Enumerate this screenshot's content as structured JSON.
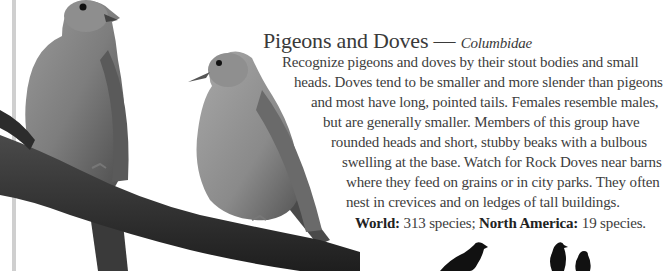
{
  "header": {
    "title": "Pigeons and Doves",
    "dash": " — ",
    "family": "Columbidae"
  },
  "body": {
    "lines": [
      "Recognize pigeons and doves by their stout bodies and small",
      "heads. Doves tend to be smaller and more slender than pigeons",
      "and most have long, pointed tails. Females resemble males,",
      "but are generally smaller. Members of this group have",
      "rounded heads and short, stubby beaks with a bulbous",
      "swelling at the base. Watch for Rock Doves near barns",
      "where they feed on grains or in city parks. They often",
      "nest in crevices and on ledges of tall buildings."
    ],
    "stats": {
      "world_label": "World:",
      "world_value": " 313 species; ",
      "na_label": "North America:",
      "na_value": " 19 species."
    }
  },
  "images": {
    "photo": "two-mourning-doves-on-branch",
    "silhouettes": [
      "pigeon-silhouette",
      "dove-pair-silhouette"
    ]
  }
}
